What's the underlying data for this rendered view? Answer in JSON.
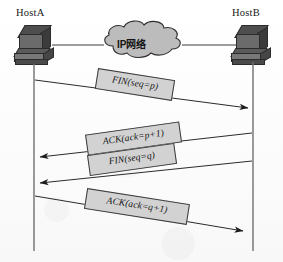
{
  "diagram": {
    "background_color": "#fdfdfd",
    "line_color": "#333333",
    "label_fill": "#d2d2d2",
    "label_border": "#3a3a3a",
    "cloud_fill": "#b9b9b9",
    "cloud_stroke": "#2e2e2e",
    "host_icon_color": "#5a5a5a"
  },
  "hosts": {
    "left": {
      "label": "HostA",
      "icon": "server-computer-icon"
    },
    "right": {
      "label": "HostB",
      "icon": "server-computer-icon"
    }
  },
  "network": {
    "cloud_label": "IP网络",
    "icon": "network-cloud-icon"
  },
  "messages": [
    {
      "id": "fin-seq-p",
      "label": "FIN(seq=p)",
      "direction": "left-to-right",
      "order": 1
    },
    {
      "id": "ack-ack-p-plus-1",
      "label": "ACK(ack=p+1)",
      "direction": "right-to-left",
      "order": 2
    },
    {
      "id": "fin-seq-q",
      "label": "FIN(seq=q)",
      "direction": "right-to-left",
      "order": 3
    },
    {
      "id": "ack-ack-q-plus-1",
      "label": "ACK(ack=q+1)",
      "direction": "left-to-right",
      "order": 4
    }
  ]
}
